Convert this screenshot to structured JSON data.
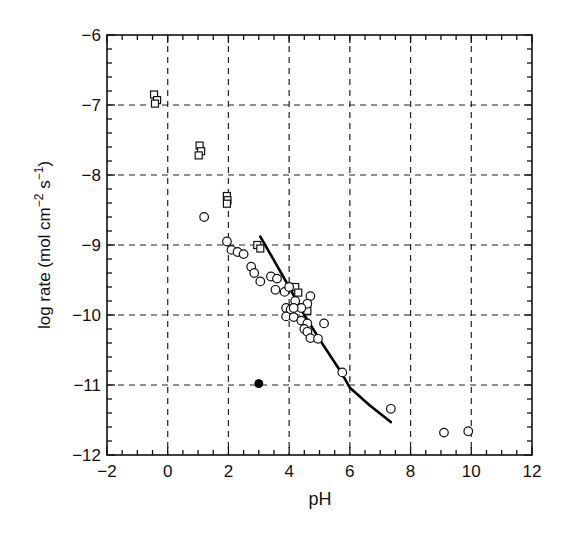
{
  "chart_data": {
    "type": "scatter",
    "title": "",
    "xlabel": "pH",
    "ylabel": "log rate (mol cm⁻² s⁻¹)",
    "ylabel_parts": {
      "main": "log rate (mol cm",
      "sup1": "−2",
      "mid": " s",
      "sup2": "−1",
      "end": ")"
    },
    "xlim": [
      -2,
      12
    ],
    "ylim": [
      -12,
      -6
    ],
    "xticks": [
      -2,
      0,
      2,
      4,
      6,
      8,
      10,
      12
    ],
    "xtick_labels": [
      "−2",
      "0",
      "2",
      "4",
      "6",
      "8",
      "10",
      "12"
    ],
    "yticks": [
      -12,
      -11,
      -10,
      -9,
      -8,
      -7,
      -6
    ],
    "ytick_labels": [
      "−12",
      "−11",
      "−10",
      "−9",
      "−8",
      "−7",
      "−6"
    ],
    "x_minor_step": 0.5,
    "y_minor_step": 0.2,
    "grid": true,
    "grid_style": "dashed",
    "legend": null,
    "series": [
      {
        "name": "squares",
        "marker": "open-square",
        "points": [
          [
            -0.45,
            -6.85
          ],
          [
            -0.35,
            -6.93
          ],
          [
            -0.42,
            -6.98
          ],
          [
            1.05,
            -7.58
          ],
          [
            1.1,
            -7.66
          ],
          [
            1.02,
            -7.72
          ],
          [
            1.95,
            -8.3
          ],
          [
            1.97,
            -8.36
          ],
          [
            1.95,
            -8.41
          ],
          [
            2.95,
            -9.0
          ],
          [
            3.05,
            -9.05
          ],
          [
            4.2,
            -9.6
          ],
          [
            4.3,
            -9.68
          ],
          [
            4.6,
            -9.94
          ]
        ]
      },
      {
        "name": "circles",
        "marker": "open-circle",
        "points": [
          [
            1.2,
            -8.6
          ],
          [
            1.95,
            -8.95
          ],
          [
            2.1,
            -9.07
          ],
          [
            2.3,
            -9.1
          ],
          [
            2.5,
            -9.13
          ],
          [
            2.75,
            -9.31
          ],
          [
            2.85,
            -9.4
          ],
          [
            3.05,
            -9.52
          ],
          [
            3.4,
            -9.45
          ],
          [
            3.6,
            -9.48
          ],
          [
            3.55,
            -9.64
          ],
          [
            3.85,
            -9.67
          ],
          [
            4.0,
            -9.6
          ],
          [
            4.7,
            -9.73
          ],
          [
            4.2,
            -9.8
          ],
          [
            4.6,
            -9.84
          ],
          [
            4.4,
            -9.9
          ],
          [
            3.9,
            -9.9
          ],
          [
            4.05,
            -9.92
          ],
          [
            4.15,
            -9.9
          ],
          [
            3.9,
            -10.02
          ],
          [
            4.15,
            -10.03
          ],
          [
            4.4,
            -10.08
          ],
          [
            4.6,
            -10.12
          ],
          [
            5.15,
            -10.12
          ],
          [
            4.5,
            -10.2
          ],
          [
            4.6,
            -10.24
          ],
          [
            4.7,
            -10.33
          ],
          [
            4.95,
            -10.34
          ],
          [
            5.75,
            -10.82
          ],
          [
            7.35,
            -11.34
          ],
          [
            9.1,
            -11.68
          ],
          [
            9.9,
            -11.66
          ]
        ]
      },
      {
        "name": "filled",
        "marker": "filled-circle",
        "points": [
          [
            3.0,
            -10.98
          ]
        ]
      }
    ],
    "curve": {
      "name": "model fit",
      "style": "solid-thick",
      "points": [
        [
          3.05,
          -8.88
        ],
        [
          3.5,
          -9.22
        ],
        [
          4.0,
          -9.6
        ],
        [
          4.5,
          -10.0
        ],
        [
          5.05,
          -10.38
        ],
        [
          5.7,
          -10.81
        ],
        [
          6.0,
          -11.04
        ],
        [
          6.65,
          -11.29
        ],
        [
          7.35,
          -11.53
        ]
      ]
    }
  }
}
